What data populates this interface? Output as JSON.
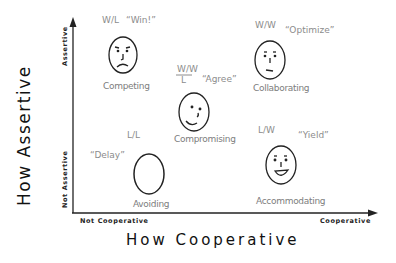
{
  "diagram": {
    "title_y": "How Assertive",
    "title_x": "How Cooperative",
    "y_axis": {
      "top_label": "Assertive",
      "bottom_label": "Not Assertive"
    },
    "x_axis": {
      "left_label": "Not Cooperative",
      "right_label": "Cooperative"
    },
    "styles": [
      {
        "name": "Competing",
        "outcome": "W/L",
        "quote": "“Win!”",
        "face": "frown"
      },
      {
        "name": "Collaborating",
        "outcome": "W/W",
        "quote": "“Optimize”",
        "face": "neutral"
      },
      {
        "name": "Compromising",
        "outcome": "W/W over L",
        "outcome_top": "W/W",
        "outcome_bottom": "L",
        "quote": "“Agree”",
        "face": "smirk"
      },
      {
        "name": "Avoiding",
        "outcome": "L/L",
        "quote": "“Delay”",
        "face": "blank"
      },
      {
        "name": "Accommodating",
        "outcome": "L/W",
        "quote": "“Yield”",
        "face": "smile"
      }
    ]
  }
}
